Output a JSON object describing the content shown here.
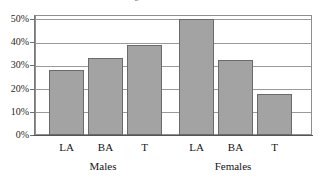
{
  "chart_data": {
    "type": "bar",
    "title": "",
    "title_clipped_fragment": "e",
    "xlabel": "",
    "ylabel": "",
    "ylim": [
      0,
      50
    ],
    "ytick_labels": [
      "0%",
      "10%",
      "20%",
      "30%",
      "40%",
      "50%"
    ],
    "ytick_values": [
      0,
      10,
      20,
      30,
      40,
      50
    ],
    "grid": true,
    "legend": "none",
    "categories": [
      "LA",
      "BA",
      "T",
      "LA",
      "BA",
      "T"
    ],
    "values": [
      28,
      33,
      39,
      50,
      32.5,
      17.5
    ],
    "groups": [
      {
        "label": "Males",
        "categories": [
          "LA",
          "BA",
          "T"
        ],
        "values": [
          28,
          33,
          39
        ]
      },
      {
        "label": "Females",
        "categories": [
          "LA",
          "BA",
          "T"
        ],
        "values": [
          50,
          32.5,
          17.5
        ]
      }
    ],
    "bars": [
      {
        "group": "Males",
        "category": "LA",
        "value": 28,
        "value_label": "28%",
        "x": 49,
        "width": 35
      },
      {
        "group": "Males",
        "category": "BA",
        "value": 33,
        "value_label": "33%",
        "x": 88,
        "width": 35
      },
      {
        "group": "Males",
        "category": "T",
        "value": 39,
        "value_label": "39%",
        "x": 127,
        "width": 35
      },
      {
        "group": "Females",
        "category": "LA",
        "value": 50,
        "value_label": "50%",
        "x": 179,
        "width": 35
      },
      {
        "group": "Females",
        "category": "BA",
        "value": 32.5,
        "value_label": "32.5%",
        "x": 218,
        "width": 35
      },
      {
        "group": "Females",
        "category": "T",
        "value": 17.5,
        "value_label": "17.5%",
        "x": 257,
        "width": 35
      }
    ],
    "colors": {
      "bar_fill": "#a3a3a3",
      "bar_border": "#6a6a6a",
      "gridline": "#9a9a9a",
      "axis": "#7a7a7a",
      "baseline": "#555555",
      "text": "#141414",
      "background": "#ffffff"
    }
  }
}
